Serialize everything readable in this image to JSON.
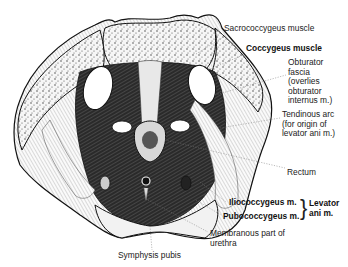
{
  "figure": {
    "labels": {
      "sacrococcygeus": "Sacrococcygeus muscle",
      "coccygeus": "Coccygeus muscle",
      "obturator_fascia": [
        "Obturator",
        "fascia",
        "(overlies",
        "obturator",
        "internus m.)"
      ],
      "tendinous_arc": [
        "Tendinous arc",
        "(for origin of",
        "levator ani m.)"
      ],
      "rectum": "Rectum",
      "iliococcygeus": "Iliococcygeus m.",
      "pubococcygeus": "Pubococcygeus m.",
      "levator_ani": [
        "Levator",
        "ani m."
      ],
      "membranous_urethra": [
        "Membranous part of",
        "urethra"
      ],
      "symphysis_pubis": "Symphysis pubis"
    },
    "colors": {
      "ink": "#111111",
      "bone_fill": "#f4f4f4",
      "muscle_dark": "#1a1a1a",
      "background": "#ffffff"
    }
  }
}
